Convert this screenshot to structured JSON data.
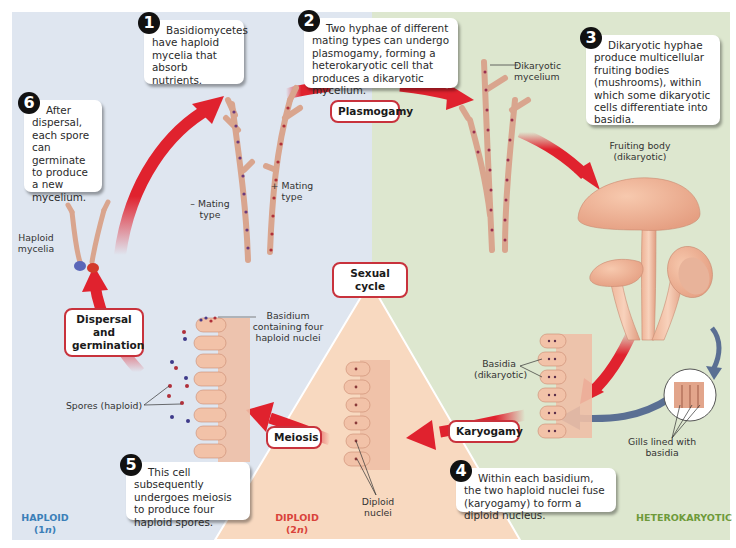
{
  "figure": {
    "colors": {
      "haploid_bg": "#dfe6f0",
      "heterokaryotic_bg": "#dde7cf",
      "diploid_bg": "#f8d9c0",
      "arrow_red": "#e0222e",
      "arrow_blue": "#5a6f93",
      "label_border": "#c8323c",
      "haploid_text": "#3b7fb8",
      "diploid_text": "#d9433a",
      "heterokaryotic_text": "#6e9a3a"
    },
    "center_label": "Sexual cycle",
    "phases": {
      "haploid": {
        "name": "HAPLOID",
        "ploidy_prefix": "(1",
        "ploidy_n": "n",
        "ploidy_suffix": ")"
      },
      "diploid": {
        "name": "DIPLOID",
        "ploidy_prefix": "(2",
        "ploidy_n": "n",
        "ploidy_suffix": ")"
      },
      "heterokaryotic": {
        "name": "HETEROKARYOTIC"
      }
    },
    "steps": [
      {
        "number": "1",
        "text": "Basidiomycetes have haploid mycelia that absorb nutrients."
      },
      {
        "number": "2",
        "text": "Two hyphae of different mating types can undergo plasmogamy, forming a heterokaryotic cell that produces a dikaryotic mycelium."
      },
      {
        "number": "3",
        "text": "Dikaryotic hyphae produce multicellular fruiting bodies (mushrooms), within which some dikaryotic cells differentiate into basidia."
      },
      {
        "number": "4",
        "text": "Within each basidium, the two haploid nuclei fuse (karyogamy) to form a diploid nucleus."
      },
      {
        "number": "5",
        "text": "This cell subsequently undergoes meiosis to produce four haploid spores."
      },
      {
        "number": "6",
        "text": "After dispersal, each spore can germinate to produce a new mycelium."
      }
    ],
    "processes": {
      "plasmogamy": "Plasmogamy",
      "karyogamy": "Karyogamy",
      "meiosis": "Meiosis",
      "dispersal_line1": "Dispersal and",
      "dispersal_line2": "germination"
    },
    "labels": {
      "minus_mating_1": "– Mating",
      "minus_mating_2": "type",
      "plus_mating_1": "+ Mating",
      "plus_mating_2": "type",
      "dikaryotic_mycelium_1": "Dikaryotic",
      "dikaryotic_mycelium_2": "mycelium",
      "fruiting_body_1": "Fruiting body",
      "fruiting_body_2": "(dikaryotic)",
      "basidia_1": "Basidia",
      "basidia_2": "(dikaryotic)",
      "gills_1": "Gills lined with",
      "gills_2": "basidia",
      "diploid_nuclei_1": "Diploid",
      "diploid_nuclei_2": "nuclei",
      "basidium_four_1": "Basidium",
      "basidium_four_2": "containing four",
      "basidium_four_3": "haploid nuclei",
      "spores": "Spores (haploid)",
      "haploid_mycelia_1": "Haploid",
      "haploid_mycelia_2": "mycelia"
    }
  }
}
